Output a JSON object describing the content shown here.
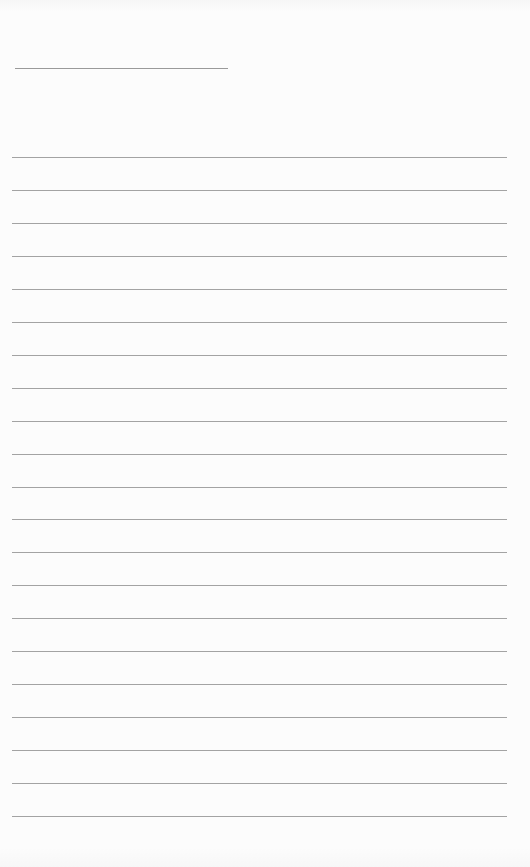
{
  "document": {
    "type": "blank lined sheet",
    "title_line": {
      "x": 15,
      "y": 68,
      "width": 213,
      "color": "#9a9a9a"
    },
    "rules": {
      "count": 21,
      "first_y": 157,
      "spacing": 32.95,
      "x": 12,
      "width": 495,
      "color": "#a3a3a3"
    },
    "background": "#fcfcfc",
    "text": []
  }
}
